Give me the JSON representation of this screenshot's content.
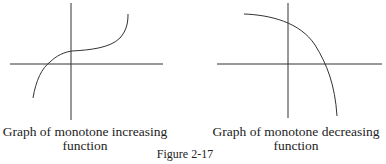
{
  "figure": {
    "title": "Figure 2-17",
    "panels": [
      {
        "caption_line1": "Graph of monotone increasing",
        "caption_line2": "function",
        "curve_type": "increasing"
      },
      {
        "caption_line1": "Graph of monotone decreasing",
        "caption_line2": "function",
        "curve_type": "decreasing"
      }
    ]
  },
  "colors": {
    "line": "#333333",
    "background": "#ffffff"
  }
}
